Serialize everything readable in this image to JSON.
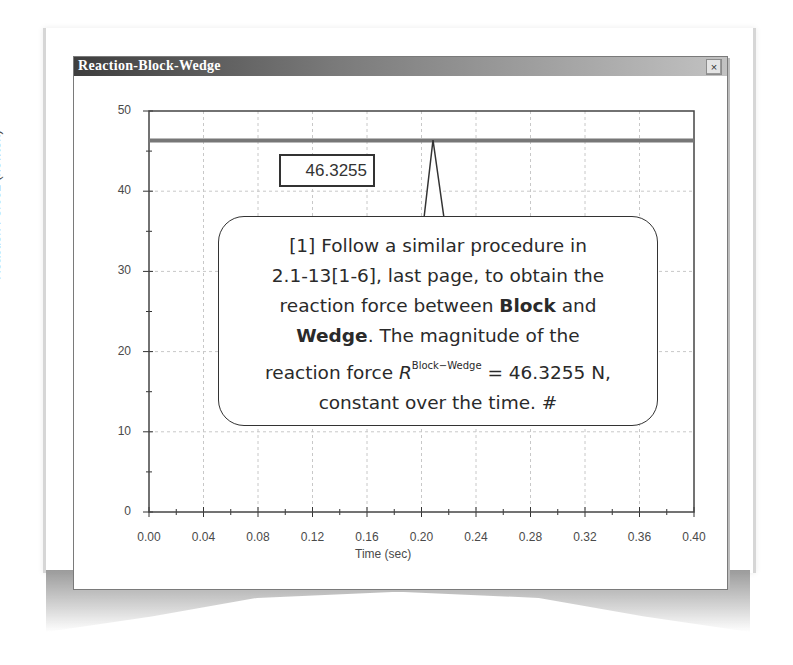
{
  "window": {
    "title": "Reaction-Block-Wedge",
    "close_glyph": "×"
  },
  "chart_data": {
    "type": "line",
    "title": "Reaction-Block-Wedge",
    "xlabel": "Time (sec)",
    "ylabel": "Reaction Force2 (newton)",
    "xlim": [
      0.0,
      0.4
    ],
    "ylim": [
      0,
      50
    ],
    "grid": true,
    "x_ticks": [
      "0.00",
      "0.04",
      "0.08",
      "0.12",
      "0.16",
      "0.20",
      "0.24",
      "0.28",
      "0.32",
      "0.36",
      "0.40"
    ],
    "y_ticks": [
      "0",
      "10",
      "20",
      "30",
      "40",
      "50"
    ],
    "series": [
      {
        "name": "Reaction Force2",
        "x": [
          0.0,
          0.4
        ],
        "values": [
          46.3255,
          46.3255
        ],
        "color": "#777777"
      }
    ],
    "annotations": [
      {
        "type": "value-label",
        "text": "46.3255",
        "x": 0.21,
        "y": 46.3255
      }
    ]
  },
  "value_label": "46.3255",
  "callout": {
    "line1": "[1] Follow a similar procedure in",
    "line2": "2.1-13[1-6], last page, to obtain the",
    "line3_pre": "reaction force between ",
    "line3_bold": "Block",
    "line3_post": " and",
    "line4_bold": "Wedge",
    "line4_post": ". The magnitude of the",
    "line5_pre": "reaction force ",
    "line5_symbol": "R",
    "line5_superscript": "Block−Wedge",
    "line5_post": " = 46.3255 N,",
    "line6": "constant over the time. #"
  }
}
